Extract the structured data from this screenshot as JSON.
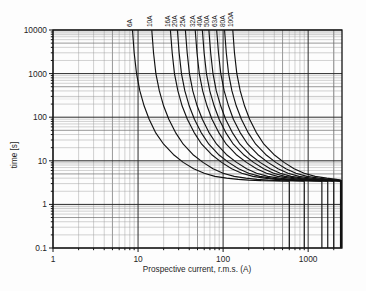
{
  "chart_data": {
    "type": "line",
    "title": "",
    "subtitle": "",
    "xlabel": "Prospective current, r.m.s. (A)",
    "ylabel": "time [s]",
    "xscale": "log",
    "yscale": "log",
    "xlim": [
      1,
      2500
    ],
    "ylim": [
      0.1,
      10000
    ],
    "grid": true,
    "legend_position": "inline-top (rotated curve labels above plot)",
    "xticks": [
      1,
      10,
      100,
      1000
    ],
    "xtick_labels": [
      "1",
      "10",
      "100",
      "1000"
    ],
    "yticks": [
      0.1,
      1,
      10,
      100,
      1000,
      10000
    ],
    "ytick_labels": [
      "0.1",
      "1",
      "10",
      "100",
      "1000",
      "10000"
    ],
    "annotations": [
      "6A",
      "10A",
      "16A",
      "20A",
      "25A",
      "32A",
      "40A",
      "50A",
      "63A",
      "80A",
      "100A"
    ],
    "series": [
      {
        "name": "6A",
        "label": "6A",
        "label_x": 8.6,
        "x": [
          8.6,
          9.0,
          9.6,
          10.5,
          11.8,
          13.5,
          16,
          20,
          26,
          34,
          45,
          60,
          80,
          110,
          150,
          200,
          280,
          400,
          600,
          600
        ],
        "y": [
          10000,
          3000,
          1000,
          400,
          180,
          90,
          45,
          24,
          14,
          9.2,
          6.6,
          5.2,
          4.4,
          4.0,
          3.75,
          3.6,
          3.5,
          3.45,
          3.4,
          0.1
        ]
      },
      {
        "name": "10A",
        "label": "10A",
        "label_x": 14.5,
        "x": [
          14.5,
          15.2,
          16.2,
          17.8,
          20,
          23,
          27.5,
          34,
          44,
          58,
          76,
          100,
          135,
          185,
          250,
          340,
          470,
          660,
          900,
          900
        ],
        "y": [
          10000,
          3000,
          1000,
          400,
          180,
          90,
          45,
          24,
          14,
          9.2,
          6.6,
          5.2,
          4.4,
          4.0,
          3.75,
          3.6,
          3.5,
          3.45,
          3.4,
          0.1
        ]
      },
      {
        "name": "16A",
        "label": "16A",
        "label_x": 24,
        "x": [
          24,
          25.2,
          26.8,
          29.4,
          33,
          38,
          45.5,
          56,
          73,
          96,
          126,
          166,
          224,
          306,
          414,
          562,
          778,
          1090,
          1450,
          1450
        ],
        "y": [
          10000,
          3000,
          1000,
          400,
          180,
          90,
          45,
          24,
          14,
          9.2,
          6.6,
          5.2,
          4.4,
          4.0,
          3.75,
          3.6,
          3.5,
          3.45,
          3.4,
          0.1
        ]
      },
      {
        "name": "20A",
        "label": "20A",
        "label_x": 29,
        "x": [
          29,
          30.4,
          32.4,
          35.5,
          40,
          46,
          55,
          68,
          88,
          116,
          152,
          200,
          270,
          370,
          500,
          680,
          940,
          1320,
          1700,
          1700
        ],
        "y": [
          10000,
          3000,
          1000,
          400,
          180,
          90,
          45,
          24,
          14,
          9.2,
          6.6,
          5.2,
          4.4,
          4.0,
          3.75,
          3.6,
          3.5,
          3.45,
          3.4,
          0.1
        ]
      },
      {
        "name": "25A",
        "label": "25A",
        "label_x": 36,
        "x": [
          36,
          37.8,
          40.2,
          44,
          49.6,
          57,
          68,
          84,
          109,
          144,
          189,
          248,
          335,
          459,
          620,
          843,
          1166,
          1630,
          2000,
          2000
        ],
        "y": [
          10000,
          3000,
          1000,
          400,
          180,
          90,
          45,
          24,
          14,
          9.2,
          6.6,
          5.2,
          4.4,
          4.0,
          3.75,
          3.6,
          3.5,
          3.45,
          3.4,
          0.1
        ]
      },
      {
        "name": "32A",
        "label": "32A",
        "label_x": 47,
        "x": [
          47,
          49.3,
          52.5,
          57.5,
          64.8,
          74,
          88.6,
          109,
          142,
          188,
          247,
          324,
          437,
          599,
          809,
          1100,
          1520,
          2100,
          2400,
          2400
        ],
        "y": [
          10000,
          3000,
          1000,
          400,
          180,
          90,
          45,
          24,
          14,
          9.2,
          6.6,
          5.2,
          4.4,
          4.0,
          3.75,
          3.6,
          3.5,
          3.45,
          3.4,
          0.1
        ]
      },
      {
        "name": "40A",
        "label": "40A",
        "label_x": 57,
        "x": [
          57,
          59.8,
          63.7,
          69.7,
          78.6,
          89.8,
          107,
          132,
          173,
          228,
          300,
          393,
          530,
          727,
          981,
          1335,
          1845,
          2300,
          2450,
          2450
        ],
        "y": [
          10000,
          3000,
          1000,
          400,
          180,
          90,
          45,
          24,
          14,
          9.2,
          6.6,
          5.2,
          4.4,
          4.0,
          3.75,
          3.6,
          3.5,
          3.45,
          3.4,
          0.1
        ]
      },
      {
        "name": "50A",
        "label": "50A",
        "label_x": 68,
        "x": [
          68,
          71.4,
          76,
          83.2,
          93.8,
          107,
          128,
          158,
          206,
          272,
          358,
          469,
          632,
          867,
          1170,
          1592,
          2100,
          2450,
          2500,
          2500
        ],
        "y": [
          10000,
          3000,
          1000,
          400,
          180,
          90,
          45,
          24,
          14,
          9.2,
          6.6,
          5.2,
          4.4,
          4.0,
          3.75,
          3.6,
          3.5,
          3.45,
          3.4,
          0.1
        ]
      },
      {
        "name": "63A",
        "label": "63A",
        "label_x": 84,
        "x": [
          84,
          88.2,
          93.9,
          103,
          116,
          132,
          158,
          195,
          255,
          336,
          442,
          580,
          781,
          1071,
          1446,
          1967,
          2350,
          2480,
          2500,
          2500
        ],
        "y": [
          10000,
          3000,
          1000,
          400,
          180,
          90,
          45,
          24,
          14,
          9.2,
          6.6,
          5.2,
          4.4,
          4.0,
          3.75,
          3.6,
          3.5,
          3.45,
          3.4,
          0.1
        ]
      },
      {
        "name": "80A",
        "label": "80A",
        "label_x": 104,
        "x": [
          104,
          109,
          116,
          127,
          143,
          164,
          196,
          242,
          316,
          416,
          547,
          718,
          967,
          1326,
          1790,
          2300,
          2450,
          2490,
          2500,
          2500
        ],
        "y": [
          10000,
          3000,
          1000,
          400,
          180,
          90,
          45,
          24,
          14,
          9.2,
          6.6,
          5.2,
          4.4,
          4.0,
          3.75,
          3.6,
          3.5,
          3.45,
          3.4,
          0.1
        ]
      },
      {
        "name": "100A",
        "label": "100A",
        "label_x": 130,
        "x": [
          130,
          136,
          145,
          159,
          179,
          205,
          245,
          302,
          395,
          520,
          684,
          897,
          1209,
          1657,
          2150,
          2400,
          2480,
          2495,
          2500,
          2500
        ],
        "y": [
          10000,
          3000,
          1000,
          400,
          180,
          90,
          45,
          24,
          14,
          9.2,
          6.6,
          5.2,
          4.4,
          4.0,
          3.75,
          3.6,
          3.5,
          3.45,
          3.4,
          0.1
        ]
      }
    ]
  },
  "axes": {
    "x_axis_label": "Prospective current, r.m.s. (A)",
    "y_axis_label": "time [s]"
  },
  "colors": {
    "background": "#fdfdfd",
    "curve": "#111111",
    "grid_major": "#2b2b2b",
    "grid_minor": "#9a9a9a",
    "frame": "#141414",
    "text": "#1a1a1a"
  }
}
